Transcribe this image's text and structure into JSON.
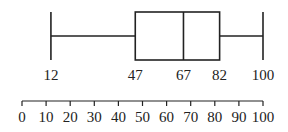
{
  "chart_data": {
    "type": "boxplot",
    "title": "",
    "xlabel": "",
    "ylabel": "",
    "five_number_summary": {
      "min": 12,
      "q1": 47,
      "median": 67,
      "q3": 82,
      "max": 100
    },
    "box_labels": [
      "12",
      "47",
      "67",
      "82",
      "100"
    ],
    "axis": {
      "range": [
        0,
        100
      ],
      "ticks": [
        0,
        10,
        20,
        30,
        40,
        50,
        60,
        70,
        80,
        90,
        100
      ],
      "tick_labels": [
        "0",
        "10",
        "20",
        "30",
        "40",
        "50",
        "60",
        "70",
        "80",
        "90",
        "100"
      ]
    },
    "orientation": "horizontal",
    "grid": false
  },
  "colors": {
    "stroke": "#222222",
    "background": "#ffffff"
  }
}
